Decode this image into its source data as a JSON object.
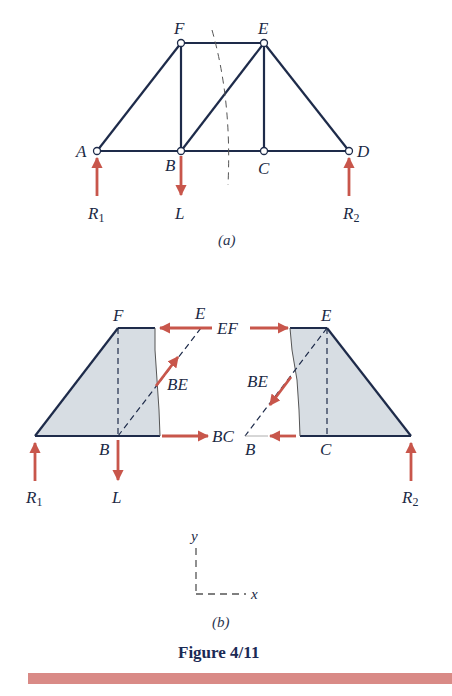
{
  "figure": {
    "caption": "Figure 4/11",
    "bar_color": "#d98a86"
  },
  "part_a": {
    "label": "(a)",
    "joints": {
      "A": "A",
      "B": "B",
      "C": "C",
      "D": "D",
      "E": "E",
      "F": "F"
    },
    "loads": {
      "R1": "R",
      "R1_sub": "1",
      "L": "L",
      "R2": "R",
      "R2_sub": "2"
    }
  },
  "part_b": {
    "label": "(b)",
    "left": {
      "F": "F",
      "E": "E",
      "B": "B",
      "EF": "EF",
      "BE": "BE",
      "BC": "BC",
      "R1": "R",
      "R1_sub": "1",
      "L": "L"
    },
    "right": {
      "E": "E",
      "C": "C",
      "B": "B",
      "BE": "BE",
      "R2": "R",
      "R2_sub": "2"
    },
    "axes": {
      "x": "x",
      "y": "y"
    }
  },
  "colors": {
    "member": "#1e2b4a",
    "force_arrow": "#c8564b",
    "section_shade": "#d7dde3"
  }
}
